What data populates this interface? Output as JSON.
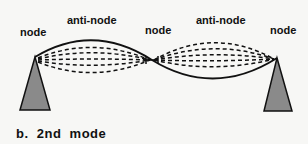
{
  "labels": {
    "node_left": "node",
    "antinode_left": "anti-node",
    "node_middle": "node",
    "antinode_right": "anti-node",
    "node_right": "node"
  },
  "caption": "b.  2nd  mode",
  "colors": {
    "background": "#f7f7f5",
    "support_fill": "#8a8a8a",
    "line": "#111111"
  }
}
